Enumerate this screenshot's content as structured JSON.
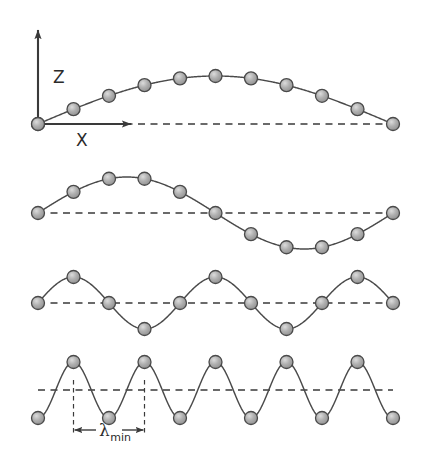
{
  "figure": {
    "background": "#ffffff",
    "stroke_color": "#4a4a4a",
    "axis_color": "#3a3a3a",
    "atom_fill": "#a8a8a8",
    "atom_edge": "#4a4a4a",
    "atom_highlight": "#d8d8d8"
  },
  "axes": {
    "z_label": "Z",
    "x_label": "X"
  },
  "annotations": {
    "lambda_symbol": "λ",
    "lambda_subscript": "min"
  },
  "chart_data": {
    "type": "line",
    "title": "",
    "xlabel": "X",
    "ylabel": "Z",
    "grid": false,
    "legend": "none",
    "lattice": {
      "atom_count": 11,
      "spacing_px": 35.5,
      "x_start_px": 38,
      "x_end_px": 393,
      "atom_radius_px": 6.5,
      "atom_x_positions": [
        38,
        73.5,
        109,
        144.5,
        180,
        215.5,
        251,
        286.5,
        322,
        357.5,
        393
      ]
    },
    "panels": [
      {
        "index": 1,
        "name": "half-wavelength-mode",
        "baseline_y_px": 124,
        "amplitude_px": 48,
        "wavelength_in_spacings": 20,
        "phase_offset": 0.0,
        "has_axes": true,
        "atom_displacements_norm": [
          0.0,
          0.309,
          0.588,
          0.809,
          0.951,
          1.0,
          0.951,
          0.809,
          0.588,
          0.309,
          0.0
        ]
      },
      {
        "index": 2,
        "name": "full-wavelength-mode",
        "baseline_y_px": 213,
        "amplitude_px": 36,
        "wavelength_in_spacings": 10,
        "phase_offset": 0.0,
        "has_axes": false,
        "atom_displacements_norm": [
          0.0,
          0.588,
          0.951,
          0.951,
          0.588,
          0.0,
          -0.588,
          -0.951,
          -0.951,
          -0.588,
          0.0
        ]
      },
      {
        "index": 3,
        "name": "quarter-wavelength-mode",
        "baseline_y_px": 303,
        "amplitude_px": 26,
        "wavelength_in_spacings": 4,
        "phase_offset": 0.0,
        "has_axes": false,
        "atom_displacements_norm": [
          0.0,
          1.0,
          0.0,
          -1.0,
          0.0,
          1.0,
          0.0,
          -1.0,
          0.0,
          1.0,
          0.0
        ]
      },
      {
        "index": 4,
        "name": "minimum-wavelength-mode",
        "baseline_y_px": 390,
        "amplitude_px": 28,
        "wavelength_in_spacings": 2,
        "phase_offset": -0.25,
        "has_axes": false,
        "lambda_min_in_spacings": 2,
        "lambda_marker_x_start_px": 73.5,
        "lambda_marker_x_end_px": 144.5,
        "atom_displacements_norm": [
          -1.0,
          1.0,
          -1.0,
          1.0,
          -1.0,
          1.0,
          -1.0,
          1.0,
          -1.0,
          1.0,
          -1.0
        ]
      }
    ]
  }
}
